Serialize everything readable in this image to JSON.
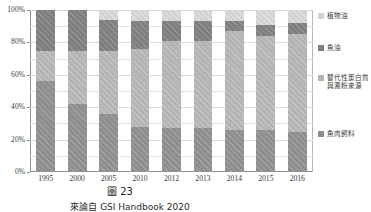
{
  "chart_data": {
    "type": "bar",
    "stacked": true,
    "normalized_percent": true,
    "title": "",
    "xlabel": "",
    "ylabel": "",
    "ylim": [
      0,
      100
    ],
    "ytick_labels": [
      "0%",
      "20%",
      "40%",
      "60%",
      "80%",
      "100%"
    ],
    "ytick_values": [
      0,
      20,
      40,
      60,
      80,
      100
    ],
    "gridlines": true,
    "gridline_step": 10,
    "legend_position": "right",
    "categories": [
      "1995",
      "2000",
      "2005",
      "2010",
      "2012",
      "2013",
      "2014",
      "2015",
      "2016"
    ],
    "series": [
      {
        "name": "魚肉飼料",
        "color": "#8e8e8e",
        "order": 1,
        "values": [
          56,
          42,
          36,
          28,
          27,
          27,
          26,
          26,
          25
        ]
      },
      {
        "name": "替代性蛋白質與澱粉來源",
        "color": "#b4b4b4",
        "order": 2,
        "values": [
          19,
          33,
          39,
          48,
          54,
          54,
          61,
          58,
          60
        ]
      },
      {
        "name": "魚油",
        "color": "#7f7f7f",
        "order": 3,
        "values": [
          25,
          25,
          19,
          17,
          12,
          12,
          6,
          7,
          7
        ]
      },
      {
        "name": "植物油",
        "color": "#d3d3d3",
        "order": 4,
        "values": [
          0,
          0,
          6,
          7,
          7,
          7,
          7,
          9,
          8
        ]
      }
    ]
  },
  "legend": {
    "items": [
      {
        "label": "植物油",
        "swatch": "s-vegoil"
      },
      {
        "label": "魚油",
        "swatch": "s-fishoil"
      },
      {
        "label": "替代性\n蛋白質\n與澱粉\n來源",
        "swatch": "s-altprotein"
      },
      {
        "label": "魚肉飼料",
        "swatch": "s-fishmeal"
      }
    ]
  },
  "caption": {
    "title": "圖 23",
    "source": "來論自 GSI Handbook 2020"
  }
}
